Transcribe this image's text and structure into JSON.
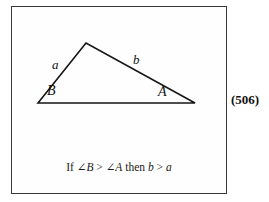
{
  "figure": {
    "number_label": "(506)",
    "caption": {
      "prefix": "If ",
      "angle_b": "∠B",
      "gt1": " > ",
      "angle_a": "∠A",
      "middle": " then ",
      "side_b": "b",
      "gt2": " > ",
      "side_a": "a",
      "full_text": "If ∠B > ∠A then b > a"
    },
    "triangle": {
      "vertices": {
        "B": {
          "label": "B",
          "x": 38,
          "y": 103
        },
        "apex": {
          "label": "",
          "x": 86,
          "y": 43
        },
        "A": {
          "label": "A",
          "x": 195,
          "y": 103
        }
      },
      "sides": [
        {
          "name": "a",
          "label": "a",
          "from": "B",
          "to": "apex",
          "label_x": 57,
          "label_y": 65
        },
        {
          "name": "b",
          "label": "b",
          "from": "apex",
          "to": "A",
          "label_x": 138,
          "label_y": 60
        },
        {
          "name": "base",
          "label": "",
          "from": "B",
          "to": "A"
        }
      ],
      "stroke_color": "#151515",
      "stroke_width": 1.6
    },
    "frame": {
      "border_color": "#3a3a3a",
      "background_color": "#fefefe"
    }
  }
}
